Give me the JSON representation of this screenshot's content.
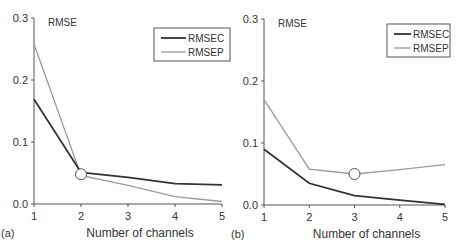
{
  "chart_data": [
    {
      "type": "line",
      "panel_label": "(a)",
      "title": "",
      "ylabel": "RMSE",
      "xlabel": "Number of channels",
      "x": [
        1,
        2,
        3,
        4,
        5
      ],
      "xticks": [
        "1",
        "2",
        "3",
        "4",
        "5"
      ],
      "yticks": [
        "0.0",
        "0.1",
        "0.2",
        "0.3"
      ],
      "ylim": [
        0,
        0.3
      ],
      "xlim": [
        1,
        5
      ],
      "grid": false,
      "legend_position": "upper right",
      "series": [
        {
          "name": "RMSEC",
          "color": "#333333",
          "values": [
            0.169,
            0.051,
            0.043,
            0.033,
            0.031
          ]
        },
        {
          "name": "RMSEP",
          "color": "#9a9a9a",
          "values": [
            0.258,
            0.046,
            0.03,
            0.012,
            0.004
          ]
        }
      ],
      "annotation": {
        "type": "circle-marker",
        "x": 2,
        "y": 0.048
      }
    },
    {
      "type": "line",
      "panel_label": "(b)",
      "title": "",
      "ylabel": "RMSE",
      "xlabel": "Number of channels",
      "x": [
        1,
        2,
        3,
        4,
        5
      ],
      "xticks": [
        "1",
        "2",
        "3",
        "4",
        "5"
      ],
      "yticks": [
        "0.0",
        "0.1",
        "0.2",
        "0.3"
      ],
      "ylim": [
        0,
        0.3
      ],
      "xlim": [
        1,
        5
      ],
      "grid": false,
      "legend_position": "upper right",
      "series": [
        {
          "name": "RMSEC",
          "color": "#333333",
          "values": [
            0.09,
            0.035,
            0.015,
            0.008,
            0.001
          ]
        },
        {
          "name": "RMSEP",
          "color": "#9a9a9a",
          "values": [
            0.17,
            0.058,
            0.05,
            0.057,
            0.065
          ]
        }
      ],
      "annotation": {
        "type": "circle-marker",
        "x": 3,
        "y": 0.05
      }
    }
  ]
}
